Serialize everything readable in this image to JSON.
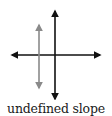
{
  "diagram": {
    "caption": "undefined slope",
    "axes": {
      "color": "#111111",
      "horizontal": {
        "x1": 12,
        "x2": 100,
        "y": 55
      },
      "vertical": {
        "x": 55,
        "y1": 10,
        "y2": 100
      }
    },
    "line": {
      "description": "vertical line (undefined slope)",
      "color": "#8a8a8a",
      "x": 39,
      "y1": 24,
      "y2": 89
    }
  }
}
